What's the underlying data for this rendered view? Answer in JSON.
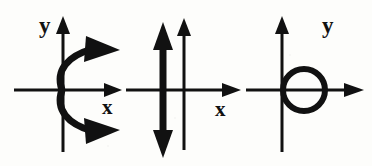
{
  "figure": {
    "background_color": "#fdfdfb",
    "ink_color": "#111111",
    "width": 372,
    "height": 166
  },
  "panels": [
    {
      "id": "panel-parabola",
      "name": "rightward-opening-parabola",
      "x_label": "x",
      "y_label": "y",
      "x_label_position": "below-right-of-axis",
      "y_label_position": "left-of-axis-top",
      "curve": {
        "type": "parabola",
        "opens": "right",
        "vertex": [
          0,
          0
        ],
        "arrowheads": [
          "upper-branch-end",
          "lower-branch-end"
        ]
      },
      "axes": {
        "x_axis_arrow": "right",
        "y_axis_arrow": "up",
        "origin_px": [
          63,
          90
        ]
      }
    },
    {
      "id": "panel-vertical-line",
      "name": "vertical-double-arrow-line",
      "x_label": "x",
      "y_label": "y",
      "x_label_position": "below-left-of-arrow",
      "y_label_position": "right-of-axis-top",
      "curve": {
        "type": "vertical-line",
        "x_value": -1,
        "arrowheads": [
          "top",
          "bottom"
        ]
      },
      "axes": {
        "x_axis_arrow": "right",
        "y_axis_arrow": "up",
        "origin_px": [
          184,
          90
        ]
      }
    },
    {
      "id": "panel-circle",
      "name": "circle-tangent-to-y-axis",
      "x_label": "x",
      "y_label": "y",
      "x_label_position": "below-right-of-axis",
      "y_label_position": "left-of-axis-top",
      "curve": {
        "type": "circle",
        "center": [
          1,
          0
        ],
        "radius": 1,
        "tangent_to": "y-axis",
        "arrowheads": []
      },
      "axes": {
        "x_axis_arrow": "right",
        "y_axis_arrow": "up",
        "origin_px": [
          282,
          90
        ]
      }
    }
  ]
}
